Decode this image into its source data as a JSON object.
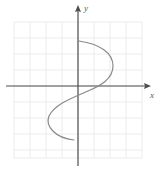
{
  "figure": {
    "background_color": "#ffffff",
    "width": 157,
    "height": 169
  },
  "axes": {
    "x_label": "x",
    "y_label": "y",
    "axis_color": "#4d4d4d",
    "x_axis_y_px": 86,
    "y_axis_x_px": 78,
    "x_arrow_tip_px": [
      151,
      86
    ],
    "y_arrow_tip_px": [
      78,
      5
    ]
  },
  "grid": {
    "color": "#ececec",
    "spacing_px": 16,
    "left_px": 14,
    "right_px": 142,
    "top_px": 22,
    "bottom_px": 158,
    "visible": true
  },
  "curve": {
    "color": "#8a8a8a",
    "stroke_width": 1.2,
    "description": "Sideways S-shaped curve: begins upper area just right of y-axis, bows right, crosses axes near origin, bows left below, ends lower left of y-axis",
    "path": "M 79 41 C 100 44, 113 53, 113 66 C 113 79, 100 86, 88 91 C 72 98, 55 104, 49 116 C 45 126, 55 138, 74 140"
  },
  "chart_data": {
    "type": "line",
    "title": "",
    "xlabel": "x",
    "ylabel": "y",
    "grid": true,
    "legend": null,
    "xlim": [
      -4,
      4
    ],
    "ylim": [
      -4.5,
      4
    ],
    "series": [
      {
        "name": "curve",
        "points_px": [
          [
            79,
            41
          ],
          [
            92,
            42
          ],
          [
            103,
            47
          ],
          [
            110,
            55
          ],
          [
            113,
            66
          ],
          [
            110,
            76
          ],
          [
            101,
            84
          ],
          [
            88,
            91
          ],
          [
            75,
            96
          ],
          [
            62,
            103
          ],
          [
            53,
            110
          ],
          [
            49,
            118
          ],
          [
            51,
            128
          ],
          [
            60,
            136
          ],
          [
            74,
            140
          ]
        ],
        "points_data": [
          [
            0.06,
            2.8
          ],
          [
            0.88,
            2.75
          ],
          [
            1.56,
            2.44
          ],
          [
            2.0,
            1.94
          ],
          [
            2.19,
            1.25
          ],
          [
            2.0,
            0.63
          ],
          [
            1.44,
            0.13
          ],
          [
            0.63,
            -0.31
          ],
          [
            -0.19,
            -0.63
          ],
          [
            -1.0,
            -1.06
          ],
          [
            -1.56,
            -1.5
          ],
          [
            -1.81,
            -2.0
          ],
          [
            -1.69,
            -2.63
          ],
          [
            -1.13,
            -3.13
          ],
          [
            -0.25,
            -3.38
          ]
        ]
      }
    ]
  }
}
